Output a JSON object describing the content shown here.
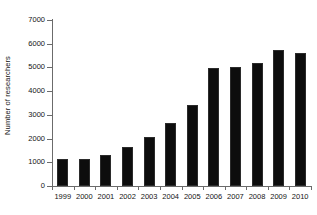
{
  "chart_data": {
    "type": "bar",
    "title": "",
    "xlabel": "",
    "ylabel": "Number of researchers",
    "categories": [
      "1999",
      "2000",
      "2001",
      "2002",
      "2003",
      "2004",
      "2005",
      "2006",
      "2007",
      "2008",
      "2009",
      "2010"
    ],
    "values": [
      1150,
      1140,
      1300,
      1650,
      2080,
      2660,
      3420,
      4980,
      5020,
      5200,
      5750,
      5590
    ],
    "ylim": [
      0,
      7000
    ],
    "y_ticks": [
      0,
      1000,
      2000,
      3000,
      4000,
      5000,
      6000,
      7000
    ],
    "y_tick_labels": [
      "0",
      "1000",
      "2000",
      "3000",
      "4000",
      "5000",
      "6000",
      "7000"
    ],
    "grid": false,
    "legend": null,
    "bar_color": "#0d0d0d",
    "axis_color": "#6b6b6b",
    "background": "#ffffff"
  }
}
